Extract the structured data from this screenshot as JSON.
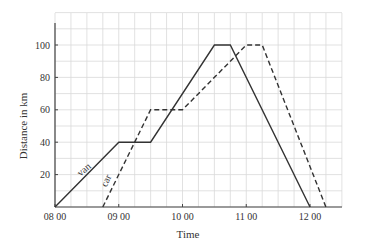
{
  "chart_data": {
    "type": "line",
    "title": "",
    "xlabel": "Time",
    "ylabel": "Distance in km",
    "x_tick_labels": [
      "08 00",
      "09 00",
      "10 00",
      "11 00",
      "12 00"
    ],
    "y_tick_labels": [
      "20",
      "40",
      "60",
      "80",
      "100"
    ],
    "xlim": [
      "08:00",
      "12:30"
    ],
    "ylim": [
      0,
      115
    ],
    "grid": true,
    "grid_x_step_minutes": 15,
    "grid_y_step": 10,
    "legend": "inline labels on lines",
    "series": [
      {
        "name": "van",
        "style": "solid",
        "points": [
          {
            "time": "08:00",
            "distance": 0
          },
          {
            "time": "09:00",
            "distance": 40
          },
          {
            "time": "09:30",
            "distance": 40
          },
          {
            "time": "10:30",
            "distance": 100
          },
          {
            "time": "10:45",
            "distance": 100
          },
          {
            "time": "12:00",
            "distance": 0
          }
        ]
      },
      {
        "name": "car",
        "style": "dashed",
        "points": [
          {
            "time": "08:45",
            "distance": 0
          },
          {
            "time": "09:30",
            "distance": 60
          },
          {
            "time": "10:00",
            "distance": 60
          },
          {
            "time": "11:00",
            "distance": 100
          },
          {
            "time": "11:15",
            "distance": 100
          },
          {
            "time": "12:15",
            "distance": 0
          }
        ]
      }
    ]
  },
  "colors": {
    "line": "#333333",
    "grid": "#d9d9d9",
    "axis": "#444444"
  }
}
